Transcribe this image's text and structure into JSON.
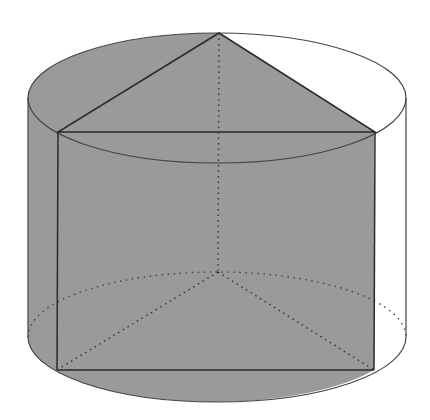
{
  "figure": {
    "colors": {
      "shade": "#9a9a9a",
      "line": "#2a2a2a",
      "background": "#ffffff"
    },
    "cylinder": {
      "cx": 217,
      "top_cy": 98,
      "bottom_cy": 337,
      "rx": 189,
      "ry": 65
    },
    "prism": {
      "top": {
        "apex": [
          219,
          33
        ],
        "left": [
          58,
          132
        ],
        "right": [
          375,
          132
        ]
      },
      "bottom": {
        "apex": [
          218,
          272
        ],
        "left": [
          57,
          370
        ],
        "right": [
          374,
          370
        ]
      }
    }
  }
}
